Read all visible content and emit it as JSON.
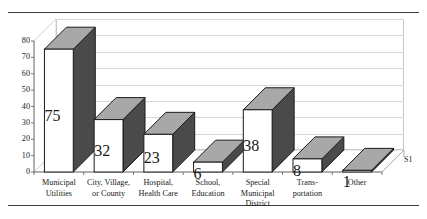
{
  "chart_data": {
    "type": "bar",
    "title": "",
    "subtitle": "",
    "xlabel": "",
    "ylabel": "",
    "ylim": [
      0,
      80
    ],
    "ytick_step": 10,
    "yticks": [
      "0",
      "10",
      "20",
      "30",
      "40",
      "50",
      "60",
      "70",
      "80"
    ],
    "grid": true,
    "legend_position": "right",
    "style": "3d-column",
    "categories": [
      "Municipal Utilities",
      "City, Village, or County",
      "Hospital, Health Care",
      "School, Education",
      "Special Municipal District",
      "Trans- portation",
      "Other"
    ],
    "category_lines": [
      [
        "Municipal",
        "Utilities"
      ],
      [
        "City, Village,",
        "or County"
      ],
      [
        "Hospital,",
        "Health Care"
      ],
      [
        "School,",
        "Education"
      ],
      [
        "Special",
        "Municipal",
        "District"
      ],
      [
        "Trans-",
        "portation"
      ],
      [
        "Other"
      ]
    ],
    "values": [
      75,
      32,
      23,
      6,
      38,
      8,
      1
    ],
    "data_labels": [
      "75",
      "32",
      "23",
      "6",
      "38",
      "8",
      "1"
    ],
    "series": [
      {
        "name": "S1",
        "values": [
          75,
          32,
          23,
          6,
          38,
          8,
          1
        ]
      }
    ],
    "legend_entries": [
      "S1"
    ]
  },
  "colors": {
    "bar_front": "#ffffff",
    "bar_top": "#a8a8a8",
    "bar_side": "#4a4a4a",
    "bar_outline": "#1a1a1a",
    "gridline": "#d7d7d7",
    "wall": "#ffffff",
    "wall_outline": "#c9c9c9",
    "rule": "#3d3d3d",
    "text": "#1a1a1a"
  }
}
